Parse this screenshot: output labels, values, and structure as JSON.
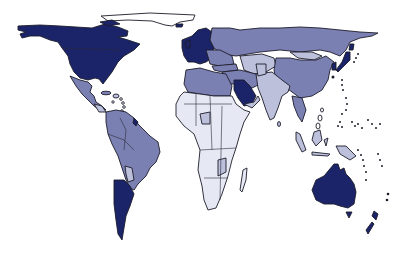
{
  "map": {
    "type": "choropleth",
    "projection": "world-outline",
    "legend": null,
    "palette": {
      "level_1_darkest": "#1b2468",
      "level_2_medium": "#7b80b2",
      "level_3_light": "#bcc0db",
      "level_4_palest": "#e6e9f3",
      "unshaded": "#ffffff",
      "outline": "#1c1c2a"
    },
    "regions": [
      {
        "name": "North America (USA/Canada)",
        "level": "level_1_darkest"
      },
      {
        "name": "Greenland",
        "level": "unshaded"
      },
      {
        "name": "Mexico & Central America",
        "level": "level_2_medium"
      },
      {
        "name": "Caribbean",
        "level": "level_3_light"
      },
      {
        "name": "South America (north/central)",
        "level": "level_2_medium"
      },
      {
        "name": "Paraguay",
        "level": "level_3_light"
      },
      {
        "name": "Argentina & Chile (south)",
        "level": "level_1_darkest"
      },
      {
        "name": "Western Europe",
        "level": "level_1_darkest"
      },
      {
        "name": "Eastern Europe",
        "level": "level_2_medium"
      },
      {
        "name": "Russia / North Asia",
        "level": "level_2_medium"
      },
      {
        "name": "Mongolia",
        "level": "level_3_light"
      },
      {
        "name": "China",
        "level": "level_2_medium"
      },
      {
        "name": "Japan",
        "level": "level_1_darkest"
      },
      {
        "name": "Korea",
        "level": "level_1_darkest"
      },
      {
        "name": "Central Asia",
        "level": "level_3_light"
      },
      {
        "name": "Middle East",
        "level": "level_2_medium"
      },
      {
        "name": "Saudi Arabia",
        "level": "level_1_darkest"
      },
      {
        "name": "India & South Asia",
        "level": "level_3_light"
      },
      {
        "name": "Southeast Asia",
        "level": "level_3_light"
      },
      {
        "name": "North Africa",
        "level": "level_2_medium"
      },
      {
        "name": "Sub-Saharan Africa",
        "level": "level_4_palest"
      },
      {
        "name": "Madagascar",
        "level": "level_4_palest"
      },
      {
        "name": "Australia",
        "level": "level_1_darkest"
      },
      {
        "name": "New Zealand",
        "level": "level_1_darkest"
      },
      {
        "name": "Pacific Islands",
        "level": "outline-dots"
      }
    ]
  }
}
